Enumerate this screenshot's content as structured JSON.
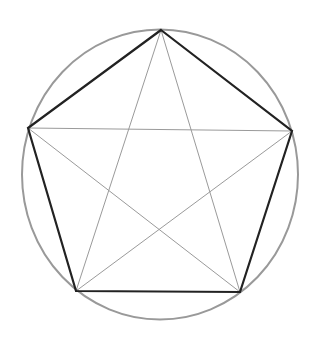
{
  "diagram": {
    "circle": {
      "cx": 160,
      "cy": 174.5,
      "rx": 138,
      "ry": 145,
      "stroke": "#999999",
      "width": 2
    },
    "vertices": [
      {
        "name": "top",
        "x": 161,
        "y": 30
      },
      {
        "name": "right",
        "x": 292,
        "y": 131
      },
      {
        "name": "bottom-right",
        "x": 240,
        "y": 292
      },
      {
        "name": "bottom-left",
        "x": 76,
        "y": 291
      },
      {
        "name": "left",
        "x": 28,
        "y": 128
      }
    ],
    "pentagon": {
      "stroke": "#222222",
      "width": 2.2
    },
    "pentagram": {
      "stroke": "#9a9a9a",
      "width": 1
    }
  }
}
